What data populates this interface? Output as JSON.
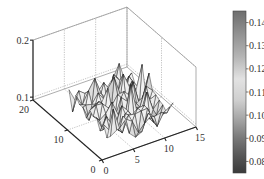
{
  "chart_data": {
    "type": "surface3d",
    "title": "",
    "xlabel": "",
    "ylabel": "",
    "zlabel": "",
    "x_range": [
      0,
      15
    ],
    "y_range": [
      0,
      20
    ],
    "z_range": [
      0.095,
      0.2
    ],
    "x_ticks": [
      0,
      5,
      10,
      15
    ],
    "x_tick_labels": [
      "0",
      "5",
      "10",
      "15"
    ],
    "y_ticks": [
      0,
      10,
      20
    ],
    "y_tick_labels": [
      "0",
      "10",
      "20"
    ],
    "z_ticks": [
      0.1,
      0.2
    ],
    "z_tick_labels": [
      "0.1",
      "0.2"
    ],
    "grid": true,
    "colormap": "gray",
    "surface": {
      "x_start": 3,
      "x_end": 13,
      "x_step": 1,
      "y_start": 3,
      "y_end": 15,
      "y_step": 1,
      "description": "Noisy surface fluctuating roughly between 0.08 and 0.14 around a mean near 0.11",
      "mean": 0.11,
      "min": 0.08,
      "max": 0.14
    },
    "colorbar": {
      "position": "right",
      "range": [
        0.075,
        0.145
      ],
      "ticks": [
        0.14,
        0.13,
        0.12,
        0.11,
        0.1,
        0.09,
        0.08
      ],
      "tick_labels": [
        "0.14",
        "0.13",
        "0.12",
        "0.11",
        "0.10",
        "0.09",
        "0.08"
      ]
    }
  },
  "colors": {
    "background": "#ffffff",
    "axis": "#222222",
    "grid": "#9a9a9a",
    "facet_edge": "#1e1e1e"
  }
}
